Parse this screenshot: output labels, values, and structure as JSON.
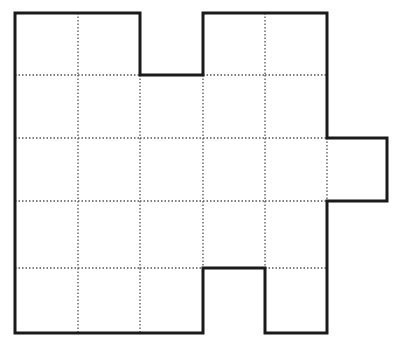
{
  "diagram": {
    "type": "grid-polyomino",
    "colors": {
      "outline": "#1a1a1a",
      "grid": "#555555",
      "background": "#ffffff"
    },
    "grid": {
      "col_x": [
        15,
        78,
        140,
        203,
        265,
        327,
        387
      ],
      "row_y": [
        13,
        75,
        138,
        201,
        268,
        333
      ]
    },
    "cells": [
      [
        1,
        1,
        0,
        1,
        1,
        0
      ],
      [
        1,
        1,
        1,
        1,
        1,
        0
      ],
      [
        1,
        1,
        1,
        1,
        1,
        1
      ],
      [
        1,
        1,
        1,
        1,
        1,
        0
      ],
      [
        1,
        1,
        1,
        0,
        1,
        0
      ]
    ],
    "cell_count": 22,
    "outline_points": [
      [
        15,
        13
      ],
      [
        140,
        13
      ],
      [
        140,
        75
      ],
      [
        203,
        75
      ],
      [
        203,
        13
      ],
      [
        327,
        13
      ],
      [
        327,
        138
      ],
      [
        387,
        138
      ],
      [
        387,
        201
      ],
      [
        327,
        201
      ],
      [
        327,
        333
      ],
      [
        265,
        333
      ],
      [
        265,
        268
      ],
      [
        203,
        268
      ],
      [
        203,
        333
      ],
      [
        15,
        333
      ]
    ]
  }
}
